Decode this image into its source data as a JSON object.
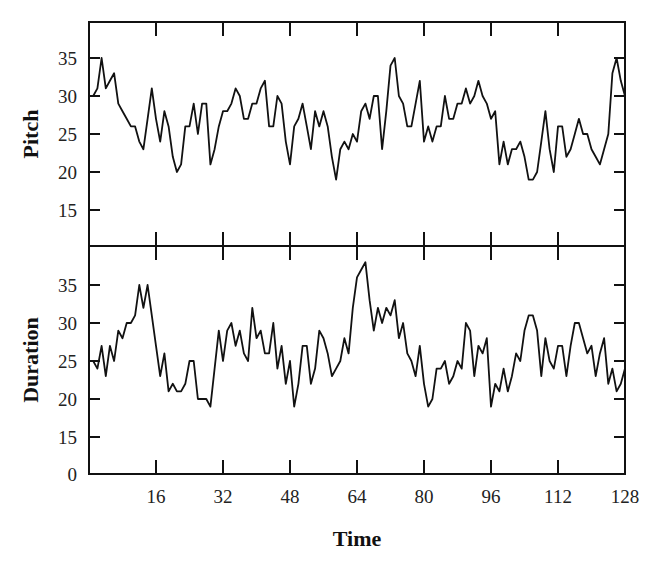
{
  "figure": {
    "x_axis_title": "Time",
    "x_ticks": [
      "16",
      "32",
      "48",
      "64",
      "80",
      "96",
      "112",
      "128"
    ],
    "panels": [
      {
        "name": "pitch",
        "y_axis_title": "Pitch",
        "y_ticks": [
          "35",
          "30",
          "25",
          "20",
          "15"
        ]
      },
      {
        "name": "duration",
        "y_axis_title": "Duration",
        "y_ticks": [
          "35",
          "30",
          "25",
          "20",
          "15",
          "0"
        ]
      }
    ]
  },
  "chart_data": [
    {
      "type": "line",
      "title": "",
      "xlabel": "Time",
      "ylabel": "Pitch",
      "xlim": [
        0,
        128
      ],
      "ylim": [
        10,
        40
      ],
      "yticks": [
        15,
        20,
        25,
        30,
        35
      ],
      "xticks": [
        16,
        32,
        48,
        64,
        80,
        96,
        112,
        128
      ],
      "grid": false,
      "x": [
        0,
        1,
        2,
        3,
        4,
        5,
        6,
        7,
        8,
        9,
        10,
        11,
        12,
        13,
        14,
        15,
        16,
        17,
        18,
        19,
        20,
        21,
        22,
        23,
        24,
        25,
        26,
        27,
        28,
        29,
        30,
        31,
        32,
        33,
        34,
        35,
        36,
        37,
        38,
        39,
        40,
        41,
        42,
        43,
        44,
        45,
        46,
        47,
        48,
        49,
        50,
        51,
        52,
        53,
        54,
        55,
        56,
        57,
        58,
        59,
        60,
        61,
        62,
        63,
        64,
        65,
        66,
        67,
        68,
        69,
        70,
        71,
        72,
        73,
        74,
        75,
        76,
        77,
        78,
        79,
        80,
        81,
        82,
        83,
        84,
        85,
        86,
        87,
        88,
        89,
        90,
        91,
        92,
        93,
        94,
        95,
        96,
        97,
        98,
        99,
        100,
        101,
        102,
        103,
        104,
        105,
        106,
        107,
        108,
        109,
        110,
        111,
        112,
        113,
        114,
        115,
        116,
        117,
        118,
        119,
        120,
        121,
        122,
        123,
        124,
        125,
        126,
        127,
        128
      ],
      "series": [
        {
          "name": "Pitch",
          "values": [
            30,
            30,
            31,
            35,
            31,
            32,
            33,
            29,
            28,
            27,
            26,
            26,
            24,
            23,
            27,
            31,
            27,
            24,
            28,
            26,
            22,
            20,
            21,
            26,
            26,
            29,
            25,
            29,
            29,
            21,
            23,
            26,
            28,
            28,
            29,
            31,
            30,
            27,
            27,
            29,
            29,
            31,
            32,
            26,
            26,
            30,
            29,
            24,
            21,
            26,
            27,
            29,
            26,
            23,
            28,
            26,
            28,
            26,
            22,
            19,
            23,
            24,
            23,
            25,
            24,
            28,
            29,
            27,
            30,
            30,
            23,
            28,
            34,
            35,
            30,
            29,
            26,
            26,
            29,
            32,
            24,
            26,
            24,
            26,
            26,
            30,
            27,
            27,
            29,
            29,
            31,
            29,
            30,
            32,
            30,
            29,
            27,
            28,
            21,
            24,
            21,
            23,
            23,
            24,
            22,
            19,
            19,
            20,
            24,
            28,
            23,
            20,
            26,
            26,
            22,
            23,
            25,
            27,
            25,
            25,
            23,
            22,
            21,
            23,
            25,
            33,
            35,
            32,
            30
          ]
        }
      ]
    },
    {
      "type": "line",
      "title": "",
      "xlabel": "Time",
      "ylabel": "Duration",
      "xlim": [
        0,
        128
      ],
      "ylim": [
        10,
        40
      ],
      "yticks": [
        0,
        15,
        20,
        25,
        30,
        35
      ],
      "xticks": [
        16,
        32,
        48,
        64,
        80,
        96,
        112,
        128
      ],
      "grid": false,
      "x": [
        0,
        1,
        2,
        3,
        4,
        5,
        6,
        7,
        8,
        9,
        10,
        11,
        12,
        13,
        14,
        15,
        16,
        17,
        18,
        19,
        20,
        21,
        22,
        23,
        24,
        25,
        26,
        27,
        28,
        29,
        30,
        31,
        32,
        33,
        34,
        35,
        36,
        37,
        38,
        39,
        40,
        41,
        42,
        43,
        44,
        45,
        46,
        47,
        48,
        49,
        50,
        51,
        52,
        53,
        54,
        55,
        56,
        57,
        58,
        59,
        60,
        61,
        62,
        63,
        64,
        65,
        66,
        67,
        68,
        69,
        70,
        71,
        72,
        73,
        74,
        75,
        76,
        77,
        78,
        79,
        80,
        81,
        82,
        83,
        84,
        85,
        86,
        87,
        88,
        89,
        90,
        91,
        92,
        93,
        94,
        95,
        96,
        97,
        98,
        99,
        100,
        101,
        102,
        103,
        104,
        105,
        106,
        107,
        108,
        109,
        110,
        111,
        112,
        113,
        114,
        115,
        116,
        117,
        118,
        119,
        120,
        121,
        122,
        123,
        124,
        125,
        126,
        127,
        128
      ],
      "series": [
        {
          "name": "Duration",
          "values": [
            25,
            25,
            24,
            27,
            23,
            27,
            25,
            29,
            28,
            30,
            30,
            31,
            35,
            32,
            35,
            31,
            27,
            23,
            26,
            21,
            22,
            21,
            21,
            22,
            25,
            25,
            20,
            20,
            20,
            19,
            24,
            29,
            25,
            29,
            30,
            27,
            29,
            26,
            25,
            32,
            28,
            29,
            26,
            26,
            30,
            24,
            27,
            22,
            25,
            19,
            22,
            27,
            27,
            22,
            24,
            29,
            28,
            26,
            23,
            24,
            25,
            28,
            26,
            32,
            36,
            37,
            38,
            33,
            29,
            32,
            30,
            32,
            31,
            33,
            28,
            30,
            26,
            25,
            23,
            27,
            22,
            19,
            20,
            24,
            24,
            25,
            22,
            23,
            25,
            24,
            30,
            29,
            23,
            27,
            26,
            28,
            19,
            22,
            21,
            24,
            21,
            23,
            26,
            25,
            29,
            31,
            31,
            29,
            23,
            28,
            25,
            24,
            27,
            27,
            23,
            27,
            30,
            30,
            28,
            26,
            27,
            23,
            26,
            28,
            22,
            24,
            21,
            22,
            24
          ]
        }
      ]
    }
  ]
}
